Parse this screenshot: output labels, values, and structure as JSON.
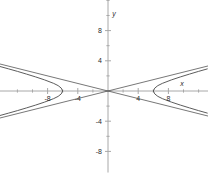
{
  "figure": {
    "width": 208,
    "height": 188,
    "background": "#ffffff",
    "axis_color": "#a8a8a8",
    "curve_color": "#4a4a4a",
    "asymptote_color": "#3c3c3c",
    "text_color": "#2b2b2b"
  },
  "axis_names": {
    "x": "x",
    "y": "y"
  },
  "chart_data": {
    "type": "line",
    "title": "",
    "xlabel": "x",
    "ylabel": "y",
    "grid": false,
    "legend": "none",
    "xlim": [
      -14.4,
      13.3
    ],
    "ylim": [
      -10.8,
      12.9
    ],
    "x_ticks": [
      -12,
      -10,
      -8,
      -6,
      -4,
      -2,
      0,
      2,
      4,
      6,
      8,
      10,
      12
    ],
    "y_ticks": [
      -8,
      -6,
      -4,
      -2,
      0,
      2,
      4,
      6,
      8,
      10,
      12
    ],
    "x_tick_labels": [
      {
        "value": -8,
        "label": "-8"
      },
      {
        "value": -4,
        "label": "-4"
      },
      {
        "value": 4,
        "label": "4"
      },
      {
        "value": 8,
        "label": "8"
      }
    ],
    "y_tick_labels": [
      {
        "value": 8,
        "label": "8"
      },
      {
        "value": 4,
        "label": "4"
      },
      {
        "value": -4,
        "label": "-4"
      },
      {
        "value": -8,
        "label": "-8"
      }
    ],
    "equation": "x^2/36 - y^2/2.25 = 1",
    "curve_kind": "hyperbola",
    "transverse_axis": "horizontal",
    "center": [
      0,
      0
    ],
    "vertices": [
      [
        -6,
        0
      ],
      [
        6,
        0
      ]
    ],
    "a": 6,
    "b": 1.5,
    "asymptote_slopes": [
      0.25,
      -0.25
    ],
    "series": [
      {
        "name": "left-branch-upper",
        "x": [
          -14.4,
          -13.2,
          -12.0,
          -10.8,
          -9.6,
          -8.4,
          -7.2,
          -6.6,
          -6.2,
          -6.0
        ],
        "y": [
          -3.27,
          -2.94,
          -2.6,
          -2.24,
          -1.87,
          -1.47,
          -1.01,
          -0.71,
          -0.39,
          0.0
        ]
      },
      {
        "name": "left-branch-lower",
        "x": [
          -14.4,
          -13.2,
          -12.0,
          -10.8,
          -9.6,
          -8.4,
          -7.2,
          -6.6,
          -6.2,
          -6.0
        ],
        "y": [
          3.27,
          2.94,
          2.6,
          2.24,
          1.87,
          1.47,
          1.01,
          0.71,
          0.39,
          0.0
        ]
      },
      {
        "name": "right-branch-upper",
        "x": [
          6.0,
          6.2,
          6.6,
          7.2,
          8.4,
          9.6,
          10.8,
          12.0,
          13.2
        ],
        "y": [
          0.0,
          0.39,
          0.71,
          1.01,
          1.47,
          1.87,
          2.24,
          2.6,
          2.94
        ]
      },
      {
        "name": "right-branch-lower",
        "x": [
          6.0,
          6.2,
          6.6,
          7.2,
          8.4,
          9.6,
          10.8,
          12.0,
          13.2
        ],
        "y": [
          0.0,
          -0.39,
          -0.71,
          -1.01,
          -1.47,
          -1.87,
          -2.24,
          -2.6,
          -2.94
        ]
      },
      {
        "name": "asymptote-positive-slope",
        "x": [
          -14.4,
          13.3
        ],
        "y": [
          -3.6,
          3.33
        ]
      },
      {
        "name": "asymptote-negative-slope",
        "x": [
          -14.4,
          13.3
        ],
        "y": [
          3.6,
          -3.33
        ]
      }
    ]
  }
}
